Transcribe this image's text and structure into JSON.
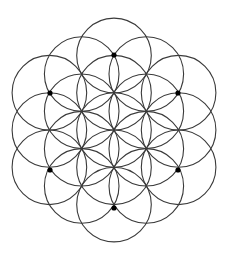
{
  "diagram": {
    "width": 233,
    "height": 257,
    "background": "#ffffff",
    "stroke_color": "#3a3a3a",
    "dot_color": "#000000",
    "center": [
      114,
      130
    ],
    "radius": 37.3,
    "circle_count": 19,
    "rings": [
      {
        "name": "center",
        "distance_factor": 0,
        "angles_deg": [
          0
        ]
      },
      {
        "name": "inner",
        "distance_factor": 1,
        "angles_deg": [
          90,
          30,
          -30,
          -90,
          -150,
          150
        ]
      },
      {
        "name": "outer-diagonal",
        "distance_factor": 1.7320508,
        "angles_deg": [
          0,
          60,
          120,
          180,
          240,
          300
        ]
      },
      {
        "name": "outer",
        "distance_factor": 2,
        "angles_deg": [
          90,
          30,
          -30,
          -90,
          -150,
          150
        ]
      }
    ],
    "dots": [
      {
        "label": "top",
        "x": 114,
        "y": 55
      },
      {
        "label": "upper-left",
        "x": 50,
        "y": 93
      },
      {
        "label": "upper-right",
        "x": 178,
        "y": 93
      },
      {
        "label": "lower-left",
        "x": 50,
        "y": 170
      },
      {
        "label": "lower-right",
        "x": 178,
        "y": 170
      },
      {
        "label": "bottom",
        "x": 114,
        "y": 208
      }
    ],
    "dot_radius": 2.6
  }
}
